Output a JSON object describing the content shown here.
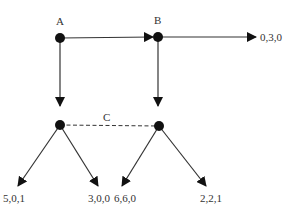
{
  "diagram": {
    "type": "game-tree",
    "nodes": [
      {
        "id": "A",
        "label": "A",
        "x": 60,
        "y": 38
      },
      {
        "id": "B",
        "label": "B",
        "x": 158,
        "y": 37
      },
      {
        "id": "C1",
        "label": "",
        "x": 60,
        "y": 125
      },
      {
        "id": "C2",
        "label": "",
        "x": 159,
        "y": 126
      }
    ],
    "information_set": {
      "label": "C",
      "members": [
        "C1",
        "C2"
      ],
      "style": "dashed"
    },
    "edges": [
      {
        "from": "A",
        "to": "B"
      },
      {
        "from": "A",
        "to": "C1"
      },
      {
        "from": "B",
        "to": "payoff_030"
      },
      {
        "from": "B",
        "to": "C2"
      },
      {
        "from": "C1",
        "to": "payoff_501"
      },
      {
        "from": "C1",
        "to": "payoff_300"
      },
      {
        "from": "C2",
        "to": "payoff_660"
      },
      {
        "from": "C2",
        "to": "payoff_221"
      }
    ],
    "payoffs": {
      "payoff_030": "0,3,0",
      "payoff_501": "5,0,1",
      "payoff_300": "3,0,0",
      "payoff_660": "6,6,0",
      "payoff_221": "2,2,1"
    },
    "colors": {
      "line": "#333333",
      "node": "#111111",
      "text": "#333333"
    }
  }
}
